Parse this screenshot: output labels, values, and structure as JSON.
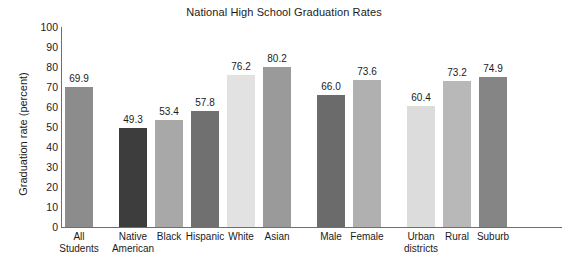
{
  "chart_data": {
    "type": "bar",
    "title": "National High School Graduation Rates",
    "xlabel": "",
    "ylabel": "Graduation rate (percent)",
    "ylim": [
      0,
      100
    ],
    "yticks": [
      0,
      10,
      20,
      30,
      40,
      50,
      60,
      70,
      80,
      90,
      100
    ],
    "ytick_labels": [
      "0",
      "10",
      "20",
      "30",
      "40",
      "50",
      "60",
      "70",
      "80",
      "90",
      "100"
    ],
    "grid": false,
    "legend": "none",
    "categories": [
      "All\nStudents",
      "Native\nAmerican",
      "Black",
      "Hispanic",
      "White",
      "Asian",
      "Male",
      "Female",
      "Urban\ndistricts",
      "Rural",
      "Suburb"
    ],
    "values": [
      69.9,
      49.3,
      53.4,
      57.8,
      76.2,
      80.2,
      66.0,
      73.6,
      60.4,
      73.2,
      74.9
    ],
    "value_labels": [
      "69.9",
      "49.3",
      "53.4",
      "57.8",
      "76.2",
      "80.2",
      "66.0",
      "73.6",
      "60.4",
      "73.2",
      "74.9"
    ],
    "bar_colors": [
      "#8c8c8c",
      "#3d3d3d",
      "#a8a8a8",
      "#707070",
      "#e2e2e2",
      "#9a9a9a",
      "#6b6b6b",
      "#b0b0b0",
      "#dcdcdc",
      "#b8b8b8",
      "#858585"
    ],
    "groups": [
      {
        "name": "overall",
        "indices": [
          0
        ]
      },
      {
        "name": "race-ethnicity",
        "indices": [
          1,
          2,
          3,
          4,
          5
        ]
      },
      {
        "name": "gender",
        "indices": [
          6,
          7
        ]
      },
      {
        "name": "locale",
        "indices": [
          8,
          9,
          10
        ]
      }
    ],
    "axis_color": "#6f6f6f",
    "text_color": "#1b1b1b",
    "background": "#ffffff"
  }
}
